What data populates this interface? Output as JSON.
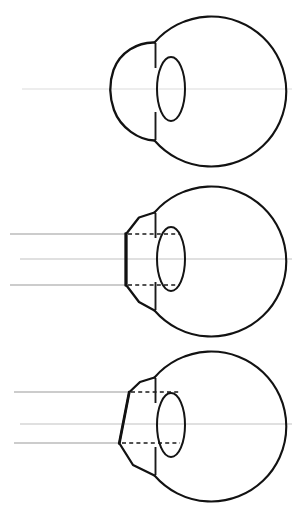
{
  "figure": {
    "background_color": "#ffffff",
    "ink_color": "#121212",
    "axis_color": "#c9c9c9",
    "ray_color": "#9a9a9a",
    "dash_color": "#1a1a1a",
    "width": 304,
    "height": 508
  },
  "panels": [
    {
      "id": "panel-1",
      "label": "Undeformed eye with normal convex cornea",
      "state": "normal-cornea",
      "top": 0,
      "parts": {
        "globe": "globe-outline",
        "cornea": "convex-cornea",
        "lens": "lens-ellipse",
        "iris_top": "iris-line-top",
        "iris_bottom": "iris-line-bottom",
        "axis": "optical-axis"
      },
      "rays": [
        {
          "name": "optical-axis-ray",
          "y": 89,
          "x_start": 22,
          "x_end": 292,
          "weight": "faint"
        }
      ],
      "dashes": []
    },
    {
      "id": "panel-2",
      "label": "Eye with symmetrically applanated (flattened) cornea",
      "state": "applanated-symmetric",
      "top": 170,
      "parts": {
        "globe": "globe-outline",
        "cornea": "flattened-cornea",
        "lens": "lens-ellipse",
        "iris_top": "iris-line-top",
        "iris_bottom": "iris-line-bottom",
        "axis": "optical-axis"
      },
      "rays": [
        {
          "name": "incident-ray-upper",
          "y": 64,
          "x_start": 10,
          "x_end": 126,
          "weight": "normal"
        },
        {
          "name": "incident-ray-middle",
          "y": 89,
          "x_start": 20,
          "x_end": 292,
          "weight": "faint"
        },
        {
          "name": "incident-ray-lower",
          "y": 115,
          "x_start": 10,
          "x_end": 126,
          "weight": "normal"
        }
      ],
      "dashes": [
        {
          "name": "applanation-dash-upper",
          "y": 64,
          "x_start": 128,
          "x_end": 180
        },
        {
          "name": "applanation-dash-lower",
          "y": 115,
          "x_start": 128,
          "x_end": 180
        }
      ]
    },
    {
      "id": "panel-3",
      "label": "Eye with obliquely applanated cornea",
      "state": "applanated-oblique",
      "top": 338,
      "parts": {
        "globe": "globe-outline",
        "cornea": "tilted-flattened-cornea",
        "lens": "lens-ellipse",
        "iris_top": "iris-line-top",
        "iris_bottom": "iris-line-bottom",
        "axis": "optical-axis"
      },
      "rays": [
        {
          "name": "incident-ray-upper",
          "y": 54,
          "x_start": 14,
          "x_end": 129,
          "weight": "normal"
        },
        {
          "name": "incident-ray-middle",
          "y": 86,
          "x_start": 20,
          "x_end": 292,
          "weight": "faint"
        },
        {
          "name": "incident-ray-lower",
          "y": 105,
          "x_start": 14,
          "x_end": 120,
          "weight": "normal"
        }
      ],
      "dashes": [
        {
          "name": "applanation-dash-upper",
          "y": 54,
          "x_start": 131,
          "x_end": 180
        },
        {
          "name": "applanation-dash-lower",
          "y": 105,
          "x_start": 122,
          "x_end": 180
        }
      ]
    }
  ],
  "geometry": {
    "globe_center_x": 217,
    "globe_center_y": 89,
    "globe_radius": 75,
    "lens_center_x": 171,
    "lens_center_y": 89,
    "lens_rx": 14,
    "lens_ry": 32,
    "iris_x": 155,
    "limbus_top_y": 43,
    "limbus_bottom_y": 140,
    "cornea_apex_x_normal": 113,
    "cornea_flat_x": 126,
    "cornea_flat_top_y": 64,
    "cornea_flat_bottom_y": 115
  }
}
